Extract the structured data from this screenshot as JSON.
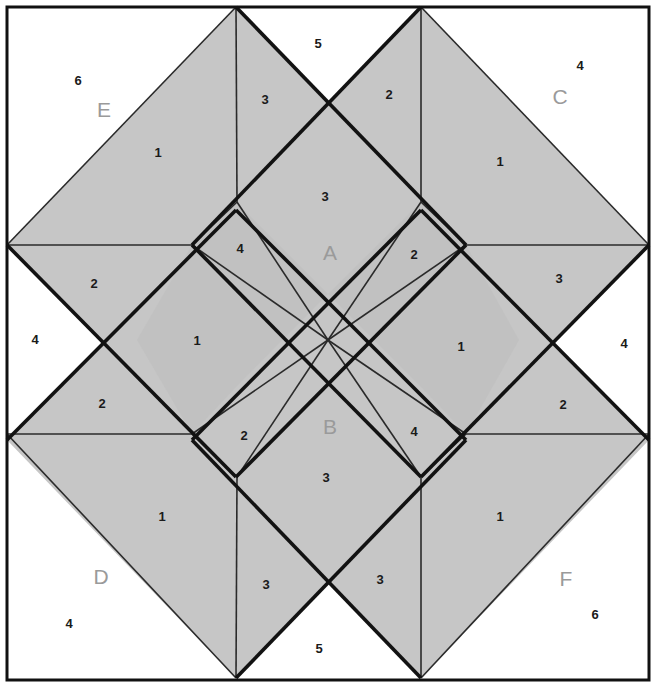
{
  "figure": {
    "width": 656,
    "height": 687,
    "colors": {
      "background": "#ffffff",
      "frame_stroke": "#111111",
      "fill_light": "#c8c8c8",
      "fill_mid": "#c0c0c0",
      "fill_dark": "#b8b8b8",
      "thin_stroke": "#1a1a1a",
      "thick_stroke": "#111111",
      "number_text": "#1a1a1a",
      "region_text": "#9a9a9a"
    },
    "frame": {
      "x": 7,
      "y": 7,
      "width": 642,
      "height": 673
    }
  },
  "region_labels": [
    {
      "id": "A",
      "text": "A",
      "x": 330,
      "y": 254
    },
    {
      "id": "B",
      "text": "B",
      "x": 330,
      "y": 428
    },
    {
      "id": "C",
      "text": "C",
      "x": 560,
      "y": 98
    },
    {
      "id": "D",
      "text": "D",
      "x": 101,
      "y": 578
    },
    {
      "id": "E",
      "text": "E",
      "x": 104,
      "y": 111
    },
    {
      "id": "F",
      "text": "F",
      "x": 566,
      "y": 580
    }
  ],
  "piece_numbers": [
    {
      "text": "1",
      "x": 158,
      "y": 154
    },
    {
      "text": "3",
      "x": 265,
      "y": 101
    },
    {
      "text": "5",
      "x": 318,
      "y": 45
    },
    {
      "text": "6",
      "x": 78,
      "y": 82
    },
    {
      "text": "2",
      "x": 389,
      "y": 96
    },
    {
      "text": "1",
      "x": 500,
      "y": 163
    },
    {
      "text": "4",
      "x": 580,
      "y": 67
    },
    {
      "text": "3",
      "x": 325,
      "y": 198
    },
    {
      "text": "4",
      "x": 240,
      "y": 250
    },
    {
      "text": "2",
      "x": 414,
      "y": 256
    },
    {
      "text": "2",
      "x": 94,
      "y": 285
    },
    {
      "text": "3",
      "x": 559,
      "y": 280
    },
    {
      "text": "4",
      "x": 35,
      "y": 341
    },
    {
      "text": "1",
      "x": 197,
      "y": 342
    },
    {
      "text": "1",
      "x": 461,
      "y": 348
    },
    {
      "text": "4",
      "x": 624,
      "y": 345
    },
    {
      "text": "2",
      "x": 102,
      "y": 405
    },
    {
      "text": "2",
      "x": 563,
      "y": 406
    },
    {
      "text": "2",
      "x": 244,
      "y": 437
    },
    {
      "text": "4",
      "x": 414,
      "y": 433
    },
    {
      "text": "3",
      "x": 326,
      "y": 479
    },
    {
      "text": "1",
      "x": 162,
      "y": 518
    },
    {
      "text": "1",
      "x": 500,
      "y": 518
    },
    {
      "text": "3",
      "x": 266,
      "y": 586
    },
    {
      "text": "3",
      "x": 380,
      "y": 581
    },
    {
      "text": "5",
      "x": 319,
      "y": 650
    },
    {
      "text": "4",
      "x": 69,
      "y": 625
    },
    {
      "text": "6",
      "x": 595,
      "y": 616
    }
  ],
  "geometry": {
    "key_points": {
      "top_left_apex": [
        236,
        7
      ],
      "top_right_apex": [
        421,
        7
      ],
      "bottom_left_apex": [
        236,
        678
      ],
      "bottom_right_apex": [
        421,
        678
      ],
      "left_upper": [
        7,
        245
      ],
      "left_lower": [
        7,
        434
      ],
      "right_upper": [
        649,
        245
      ],
      "right_lower": [
        649,
        434
      ],
      "center": [
        328,
        340
      ],
      "inner_top_left": [
        237,
        202
      ],
      "inner_top_right": [
        421,
        202
      ],
      "inner_bottom_left": [
        237,
        477
      ],
      "inner_bottom_right": [
        421,
        477
      ],
      "inner_left_upper": [
        192,
        245
      ],
      "inner_left_lower": [
        192,
        434
      ],
      "inner_right_upper": [
        466,
        245
      ],
      "inner_right_lower": [
        466,
        434
      ]
    }
  }
}
